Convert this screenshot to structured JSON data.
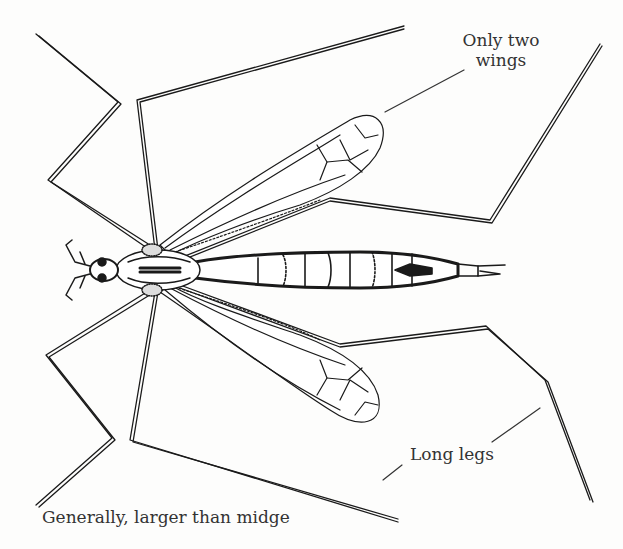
{
  "diagram": {
    "annotations": {
      "wings_line1": "Only two",
      "wings_line2": "wings",
      "legs": "Long legs",
      "size": "Generally, larger than midge"
    },
    "colors": {
      "ink": "#1a1a1a",
      "text": "#333333",
      "background": "#fdfdfc"
    }
  }
}
